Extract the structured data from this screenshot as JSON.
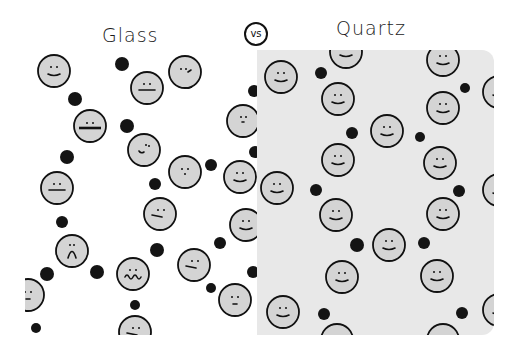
{
  "header": {
    "left_title": "Glass",
    "vs_label": "vs",
    "right_title": "Quartz"
  },
  "colors": {
    "glass_background": "#ffffff",
    "quartz_background": "#e8e8e8",
    "face_fill": "#d4d4d4",
    "outline": "#111111",
    "dot": "#141414"
  },
  "panels": [
    {
      "name": "Glass",
      "description": "Amorphous: irregular arrangement of atoms (faces) and dots",
      "faces": [
        {
          "x": 54,
          "y": 71,
          "expr": "smile"
        },
        {
          "x": 147,
          "y": 88,
          "expr": "flat"
        },
        {
          "x": 90,
          "y": 126,
          "expr": "wide-flat"
        },
        {
          "x": 144,
          "y": 150,
          "expr": "smirk"
        },
        {
          "x": 185,
          "y": 72,
          "expr": "confused"
        },
        {
          "x": 243,
          "y": 121,
          "expr": "side"
        },
        {
          "x": 185,
          "y": 172,
          "expr": "dots"
        },
        {
          "x": 240,
          "y": 177,
          "expr": "smile"
        },
        {
          "x": 57,
          "y": 188,
          "expr": "flat"
        },
        {
          "x": 160,
          "y": 214,
          "expr": "slant"
        },
        {
          "x": 246,
          "y": 225,
          "expr": "smile"
        },
        {
          "x": 72,
          "y": 251,
          "expr": "frown"
        },
        {
          "x": 133,
          "y": 274,
          "expr": "wavy"
        },
        {
          "x": 194,
          "y": 265,
          "expr": "slant"
        },
        {
          "x": 235,
          "y": 300,
          "expr": "small"
        },
        {
          "x": 28,
          "y": 295,
          "expr": "small"
        },
        {
          "x": 135,
          "y": 332,
          "expr": "slant"
        }
      ],
      "dots": [
        {
          "x": 122,
          "y": 64,
          "r": 7
        },
        {
          "x": 75,
          "y": 99,
          "r": 7
        },
        {
          "x": 127,
          "y": 126,
          "r": 7
        },
        {
          "x": 67,
          "y": 157,
          "r": 7
        },
        {
          "x": 188,
          "y": 83,
          "r": 6
        },
        {
          "x": 211,
          "y": 165,
          "r": 6
        },
        {
          "x": 155,
          "y": 184,
          "r": 6
        },
        {
          "x": 62,
          "y": 222,
          "r": 6
        },
        {
          "x": 97,
          "y": 272,
          "r": 7
        },
        {
          "x": 47,
          "y": 274,
          "r": 7
        },
        {
          "x": 157,
          "y": 250,
          "r": 7
        },
        {
          "x": 220,
          "y": 243,
          "r": 6
        },
        {
          "x": 135,
          "y": 305,
          "r": 5
        },
        {
          "x": 211,
          "y": 288,
          "r": 5
        },
        {
          "x": 36,
          "y": 328,
          "r": 5
        },
        {
          "x": 254,
          "y": 91,
          "r": 6
        },
        {
          "x": 255,
          "y": 152,
          "r": 6
        },
        {
          "x": 253,
          "y": 272,
          "r": 6
        }
      ]
    },
    {
      "name": "Quartz",
      "description": "Crystalline: regular repeating arrangement",
      "faces": [
        {
          "x": 281,
          "y": 77,
          "expr": "smile"
        },
        {
          "x": 346,
          "y": 52,
          "expr": "smile"
        },
        {
          "x": 338,
          "y": 99,
          "expr": "smile"
        },
        {
          "x": 387,
          "y": 131,
          "expr": "smile"
        },
        {
          "x": 338,
          "y": 160,
          "expr": "smile"
        },
        {
          "x": 277,
          "y": 188,
          "expr": "smile"
        },
        {
          "x": 443,
          "y": 60,
          "expr": "smile"
        },
        {
          "x": 443,
          "y": 108,
          "expr": "smile"
        },
        {
          "x": 440,
          "y": 163,
          "expr": "smile"
        },
        {
          "x": 336,
          "y": 215,
          "expr": "smile"
        },
        {
          "x": 443,
          "y": 214,
          "expr": "smile"
        },
        {
          "x": 389,
          "y": 245,
          "expr": "smile"
        },
        {
          "x": 342,
          "y": 277,
          "expr": "smile"
        },
        {
          "x": 437,
          "y": 276,
          "expr": "smile"
        },
        {
          "x": 283,
          "y": 312,
          "expr": "smile"
        },
        {
          "x": 337,
          "y": 340,
          "expr": "smile"
        },
        {
          "x": 443,
          "y": 340,
          "expr": "smile"
        },
        {
          "x": 499,
          "y": 92,
          "expr": "smile"
        },
        {
          "x": 499,
          "y": 190,
          "expr": "smile"
        },
        {
          "x": 499,
          "y": 310,
          "expr": "smile"
        }
      ],
      "dots": [
        {
          "x": 321,
          "y": 73,
          "r": 6
        },
        {
          "x": 465,
          "y": 88,
          "r": 5
        },
        {
          "x": 352,
          "y": 133,
          "r": 6
        },
        {
          "x": 420,
          "y": 137,
          "r": 5
        },
        {
          "x": 316,
          "y": 190,
          "r": 6
        },
        {
          "x": 459,
          "y": 191,
          "r": 6
        },
        {
          "x": 357,
          "y": 245,
          "r": 7
        },
        {
          "x": 424,
          "y": 243,
          "r": 6
        },
        {
          "x": 324,
          "y": 314,
          "r": 6
        },
        {
          "x": 462,
          "y": 313,
          "r": 6
        }
      ]
    }
  ]
}
